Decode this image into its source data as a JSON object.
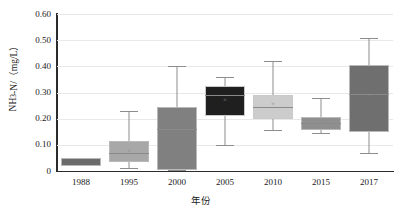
{
  "chart_data": {
    "type": "box",
    "title": "",
    "xlabel": "年份",
    "ylabel": "NH3-N/（mg/L）",
    "ylabel_parts": {
      "prefix": "NH",
      "sub": "3",
      "suffix": "-N/（mg/L）"
    },
    "categories": [
      "1988",
      "1995",
      "2000",
      "2005",
      "2010",
      "2015",
      "2017"
    ],
    "ylim": [
      0,
      0.6
    ],
    "ytick_labels": [
      "0",
      "0.10",
      "0.20",
      "0.30",
      "0.40",
      "0.50",
      "0.60"
    ],
    "ytick_values": [
      0,
      0.1,
      0.2,
      0.3,
      0.4,
      0.5,
      0.6
    ],
    "grid": "horizontal",
    "legend": "none",
    "boxes": [
      {
        "category": "1988",
        "whisker_low": 0.02,
        "q1": 0.02,
        "median": 0.035,
        "q3": 0.05,
        "whisker_high": 0.05,
        "mean": 0.035,
        "fill": "#6b6b6b",
        "show_whiskers": false,
        "show_median": false,
        "show_mean": false
      },
      {
        "category": "1995",
        "whisker_low": 0.013,
        "q1": 0.035,
        "median": 0.07,
        "q3": 0.115,
        "whisker_high": 0.23,
        "mean": 0.075,
        "fill": "#a8a8a8",
        "show_whiskers": true,
        "show_median": true,
        "show_mean": true
      },
      {
        "category": "2000",
        "whisker_low": 0.005,
        "q1": 0.005,
        "median": 0.16,
        "q3": 0.245,
        "whisker_high": 0.4,
        "mean": 0.135,
        "fill": "#808080",
        "show_whiskers": true,
        "show_median": true,
        "show_mean": true
      },
      {
        "category": "2005",
        "whisker_low": 0.1,
        "q1": 0.21,
        "median": 0.29,
        "q3": 0.325,
        "whisker_high": 0.36,
        "mean": 0.27,
        "fill": "#1f1f1f",
        "show_whiskers": true,
        "show_median": true,
        "show_mean": true
      },
      {
        "category": "2010",
        "whisker_low": 0.155,
        "q1": 0.2,
        "median": 0.245,
        "q3": 0.29,
        "whisker_high": 0.42,
        "mean": 0.255,
        "fill": "#cccccc",
        "show_whiskers": true,
        "show_median": true,
        "show_mean": true
      },
      {
        "category": "2015",
        "whisker_low": 0.145,
        "q1": 0.155,
        "median": 0.185,
        "q3": 0.205,
        "whisker_high": 0.28,
        "mean": 0.185,
        "fill": "#8f8f8f",
        "show_whiskers": true,
        "show_median": true,
        "show_mean": true
      },
      {
        "category": "2017",
        "whisker_low": 0.07,
        "q1": 0.15,
        "median": 0.295,
        "q3": 0.405,
        "whisker_high": 0.51,
        "mean": 0.29,
        "fill": "#6f6f6f",
        "show_whiskers": true,
        "show_median": true,
        "show_mean": true
      }
    ],
    "mean_marker_glyph": "×"
  }
}
